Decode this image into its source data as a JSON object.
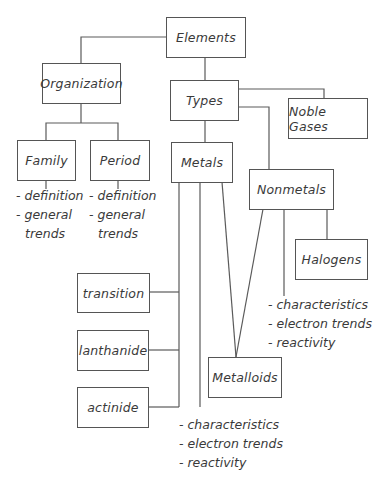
{
  "diagram": {
    "title": "Elements",
    "nodes": {
      "elements": "Elements",
      "organization": "Organization",
      "types": "Types",
      "noble_gases": "Noble Gases",
      "family": "Family",
      "period": "Period",
      "metals": "Metals",
      "nonmetals": "Nonmetals",
      "halogens": "Halogens",
      "transition": "transition",
      "lanthanide": "lanthanide",
      "actinide": "actinide",
      "metalloids": "Metalloids"
    },
    "notes": {
      "family": [
        "- definition",
        "- general",
        "trends"
      ],
      "period": [
        "- definition",
        "- general",
        "trends"
      ],
      "nonmetals": [
        "- characteristics",
        "- electron trends",
        "- reactivity"
      ],
      "metals": [
        "- characteristics",
        "- electron trends",
        "- reactivity"
      ]
    },
    "colors": {
      "line": "#5a5a5a",
      "text": "#3a3a3a",
      "background": "#ffffff"
    }
  }
}
